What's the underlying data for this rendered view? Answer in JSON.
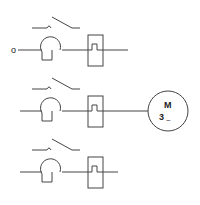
{
  "diagram": {
    "type": "electrical-schematic",
    "background": "#ffffff",
    "stroke_color": "#444444",
    "input_terminal": {
      "label": "o"
    },
    "rows": [
      {
        "id": "row-1",
        "y": 50,
        "switch_y": 28,
        "ends_at": 128,
        "connects_motor": false
      },
      {
        "id": "row-2",
        "y": 111,
        "switch_y": 89,
        "ends_at": 128,
        "connects_motor": true
      },
      {
        "id": "row-3",
        "y": 172,
        "switch_y": 150,
        "ends_at": 118,
        "connects_motor": false
      }
    ],
    "components_per_row": [
      "switch-contact",
      "thermal-overload",
      "relay-box-with-pulse"
    ],
    "motor": {
      "label": "M",
      "phase_count": "3",
      "phase_symbol": "~"
    }
  }
}
